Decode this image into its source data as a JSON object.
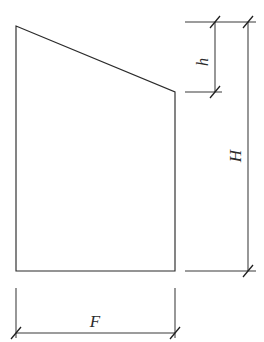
{
  "figure": {
    "type": "engineering-dimension-diagram",
    "background_color": "#ffffff",
    "line_color": "#2b2b2b",
    "dimension_line_color": "#3a3a3a"
  },
  "shape": {
    "name": "quadrilateral-outline",
    "vertices": [
      {
        "label": "top-left",
        "x": 16,
        "y": 26
      },
      {
        "label": "top-right",
        "x": 175,
        "y": 92
      },
      {
        "label": "bottom-right",
        "x": 175,
        "y": 271
      },
      {
        "label": "bottom-left",
        "x": 16,
        "y": 271
      }
    ],
    "points_attr": "16,26 175,92 175,271 16,271"
  },
  "dimensions": [
    {
      "id": "h",
      "label": "h",
      "orientation": "vertical",
      "rotated": true,
      "rotation_deg": -90,
      "line_x": 215,
      "y_start": 22,
      "y_end": 92,
      "label_x": 208,
      "label_y": 62,
      "meaning": "height of sloped top edge drop"
    },
    {
      "id": "H",
      "label": "H",
      "orientation": "vertical",
      "rotated": true,
      "rotation_deg": -90,
      "line_x": 248,
      "y_start": 22,
      "y_end": 271,
      "label_x": 241,
      "label_y": 156,
      "meaning": "total height of section"
    },
    {
      "id": "F",
      "label": "F",
      "orientation": "horizontal",
      "rotated": false,
      "rotation_deg": 0,
      "line_y": 333,
      "x_start": 16,
      "x_end": 175,
      "label_x": 95,
      "label_y": 327,
      "meaning": "base width of section"
    }
  ],
  "extension_lines": [
    {
      "id": "top-ext",
      "x1": 185,
      "y1": 22,
      "x2": 256,
      "y2": 22
    },
    {
      "id": "mid-ext",
      "x1": 185,
      "y1": 92,
      "x2": 222,
      "y2": 92
    },
    {
      "id": "bottom-ext",
      "x1": 185,
      "y1": 271,
      "x2": 256,
      "y2": 271
    },
    {
      "id": "left-ext-f",
      "x1": 16,
      "y1": 288,
      "x2": 16,
      "y2": 338
    },
    {
      "id": "right-ext-f",
      "x1": 175,
      "y1": 288,
      "x2": 175,
      "y2": 338
    }
  ],
  "tick_marks": [
    {
      "id": "tick-h-top",
      "cx": 215,
      "cy": 22
    },
    {
      "id": "tick-h-bottom",
      "cx": 215,
      "cy": 92
    },
    {
      "id": "tick-H-top",
      "cx": 248,
      "cy": 22
    },
    {
      "id": "tick-H-bottom",
      "cx": 248,
      "cy": 271
    },
    {
      "id": "tick-F-left",
      "cx": 16,
      "cy": 333
    },
    {
      "id": "tick-F-right",
      "cx": 175,
      "cy": 333
    }
  ]
}
